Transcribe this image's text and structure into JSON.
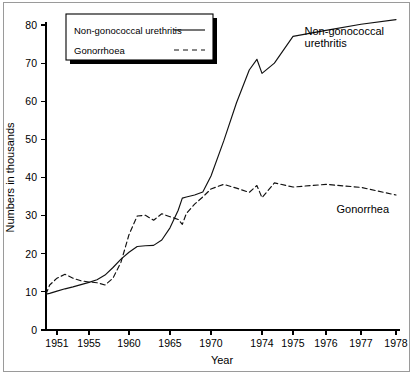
{
  "figure": {
    "name": "line-chart-std-incidence",
    "background": "#ffffff",
    "frame_color": "#9a9a9a"
  },
  "legend": {
    "position": "top-left",
    "entries": [
      {
        "label": "Non-gonococcal urethritis",
        "style": "solid"
      },
      {
        "label": "Gonorrhoea",
        "style": "dashed"
      }
    ]
  },
  "annotations": [
    {
      "name": "annotation-ngu",
      "lines": [
        "Non-gonococcal",
        "urethritis"
      ],
      "x": 1975.35,
      "y": 77.5
    },
    {
      "name": "annotation-gonorrhea",
      "lines": [
        "Gonorrhea"
      ],
      "x": 1976.3,
      "y": 30.6
    }
  ],
  "chart_data": {
    "type": "line",
    "title": "",
    "xlabel": "Year",
    "ylabel": "Numbers in thousands",
    "grid": false,
    "legend_position": "top-left",
    "xlim": [
      1949.5,
      1978.2
    ],
    "ylim": [
      0,
      83
    ],
    "yticks": [
      0,
      10,
      20,
      30,
      40,
      50,
      60,
      70,
      80
    ],
    "xticks": [
      1951,
      1955,
      1960,
      1965,
      1970,
      1974,
      1975,
      1976,
      1977,
      1978
    ],
    "x": [
      1949.5,
      1950,
      1951,
      1952,
      1953,
      1954,
      1955,
      1956,
      1957,
      1958,
      1959,
      1960,
      1961,
      1962,
      1963,
      1964,
      1965,
      1966,
      1966.5,
      1967,
      1968,
      1969,
      1970,
      1971,
      1972,
      1973,
      1973.6,
      1974,
      1974.4,
      1975,
      1976,
      1977,
      1978
    ],
    "series": [
      {
        "name": "Non-gonococcal urethritis",
        "style": "solid",
        "color": "#111111",
        "values": [
          9.4,
          9.6,
          10.2,
          10.8,
          11.3,
          11.9,
          12.5,
          13.2,
          14.4,
          16.4,
          18.6,
          20.4,
          21.9,
          22.1,
          22.2,
          23.6,
          26.8,
          31.4,
          34.6,
          34.9,
          35.4,
          36.2,
          40.4,
          49.6,
          59.6,
          68.2,
          71.0,
          67.3,
          70.0,
          77.0,
          78.6,
          80.2,
          81.4
        ]
      },
      {
        "name": "Gonorrhoea",
        "style": "dashed",
        "color": "#111111",
        "values": [
          9.4,
          11.8,
          13.6,
          14.6,
          13.6,
          12.9,
          12.6,
          12.4,
          11.8,
          13.6,
          17.8,
          25.0,
          29.9,
          30.1,
          28.8,
          30.5,
          29.7,
          29.0,
          27.7,
          30.6,
          33.0,
          34.9,
          37.0,
          38.2,
          37.2,
          36.1,
          37.9,
          34.7,
          38.6,
          37.5,
          38.2,
          37.4,
          35.4
        ]
      }
    ]
  },
  "geometry": {
    "plot_left": 46,
    "plot_right": 398,
    "plot_top": 22,
    "plot_bottom": 330,
    "x_axis_breaks": [
      {
        "year": 1949.5,
        "px": 46
      },
      {
        "year": 1951,
        "px": 57
      },
      {
        "year": 1955,
        "px": 89
      },
      {
        "year": 1960,
        "px": 129
      },
      {
        "year": 1965,
        "px": 170
      },
      {
        "year": 1970,
        "px": 211
      },
      {
        "year": 1974,
        "px": 262
      },
      {
        "year": 1975,
        "px": 293
      },
      {
        "year": 1976,
        "px": 326
      },
      {
        "year": 1977,
        "px": 361
      },
      {
        "year": 1978,
        "px": 396
      }
    ]
  }
}
